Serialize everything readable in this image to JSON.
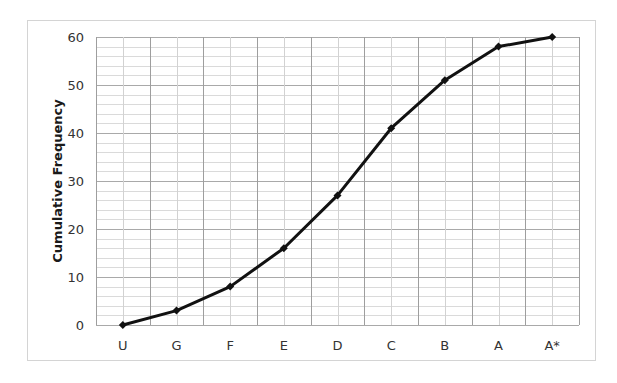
{
  "chart_data": {
    "type": "line",
    "title": "",
    "xlabel": "",
    "ylabel": "Cumulative Frequency",
    "categories": [
      "U",
      "G",
      "F",
      "E",
      "D",
      "C",
      "B",
      "A",
      "A*"
    ],
    "series": [
      {
        "name": "Cumulative Frequency",
        "values": [
          0,
          3,
          8,
          16,
          27,
          41,
          51,
          58,
          60
        ],
        "color": "#111111",
        "marker": "diamond"
      }
    ],
    "ylim": [
      0,
      60
    ],
    "yticks": [
      0,
      10,
      20,
      30,
      40,
      50,
      60
    ],
    "y_minor_step": 2,
    "grid": true,
    "legend": "none"
  },
  "colors": {
    "line": "#111111",
    "grid_major": "#a9a9a9",
    "grid_minor": "#dadada",
    "frame_border": "#d4d4d4",
    "tick_text": "#333333"
  }
}
